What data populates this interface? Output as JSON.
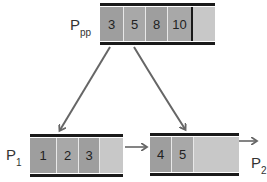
{
  "diagram": {
    "type": "B+ tree leaf split illustration",
    "nodes": [
      {
        "id": "ppp",
        "label": "P",
        "label_sub": "pp",
        "keys": [
          "3",
          "5",
          "8",
          "10"
        ],
        "empty_slots": 1
      },
      {
        "id": "p1",
        "label": "P",
        "label_sub": "1",
        "keys": [
          "1",
          "2",
          "3"
        ],
        "empty_slots": 1
      },
      {
        "id": "p2",
        "label": "P",
        "label_sub": "2",
        "keys": [
          "4",
          "5"
        ],
        "empty_slots": 1
      }
    ],
    "edges": [
      {
        "from": "ppp.key0",
        "to": "p1",
        "style": "curved-arrow"
      },
      {
        "from": "ppp.key1",
        "to": "p2",
        "style": "curved-arrow"
      },
      {
        "from": "p1",
        "to": "p2",
        "style": "sibling-arrow"
      },
      {
        "from": "p2",
        "to": "next",
        "style": "sibling-arrow"
      }
    ],
    "colors": {
      "key_cell": "#9e9e9e",
      "empty_cell": "#c8c8c8",
      "border": "#1a1a1a",
      "arrow": "#666666"
    }
  }
}
